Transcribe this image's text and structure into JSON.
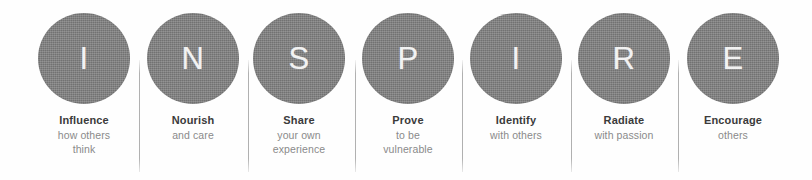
{
  "graphic": {
    "acronym": "INSPIRE",
    "circle_color": "#7c7c7c",
    "letter_color": "#f2f2f2",
    "title_color": "#3b3b3b",
    "subtitle_color": "#8a8a8a",
    "divider_color": "#acacac",
    "background_color": "#fefefe"
  },
  "items": [
    {
      "letter": "I",
      "title": "Influence",
      "subtitle": "how others\nthink"
    },
    {
      "letter": "N",
      "title": "Nourish",
      "subtitle": "and care"
    },
    {
      "letter": "S",
      "title": "Share",
      "subtitle": "your own\nexperience"
    },
    {
      "letter": "P",
      "title": "Prove",
      "subtitle": "to be\nvulnerable"
    },
    {
      "letter": "I",
      "title": "Identify",
      "subtitle": "with others"
    },
    {
      "letter": "R",
      "title": "Radiate",
      "subtitle": "with passion"
    },
    {
      "letter": "E",
      "title": "Encourage",
      "subtitle": "others"
    }
  ]
}
